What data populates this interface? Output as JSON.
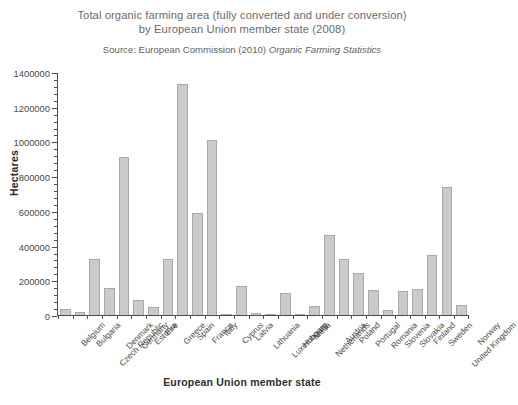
{
  "chart_data": {
    "type": "bar",
    "title": "Total organic farming area (fully converted and under conversion) by European Union member state (2008)",
    "title_line1": "Total organic farming area (fully converted and under conversion)",
    "title_line2": "by European Union member state (2008)",
    "source_prefix": "Source: European Commission (2010) ",
    "source_italic": "Organic Farming Statistics",
    "xlabel": "European Union member state",
    "ylabel": "Hectares",
    "ylim": [
      0,
      1400000
    ],
    "ytick_step": 200000,
    "yticks": [
      0,
      200000,
      400000,
      600000,
      800000,
      1000000,
      1200000,
      1400000
    ],
    "ytick_labels": [
      "0",
      "200000",
      "400000",
      "600000",
      "800000",
      "1000000",
      "1200000",
      "1400000"
    ],
    "minor_ticks_per_major": 4,
    "grid": false,
    "legend": false,
    "bar_color": "#cbcbcb",
    "bar_edge_color": "#a9a9a9",
    "categories": [
      "Belgium",
      "Bulgaria",
      "Czech Republic",
      "Denmark",
      "Germany",
      "Estonia",
      "Eire",
      "Greece",
      "Spain",
      "France",
      "Italy",
      "Cyprus",
      "Latvia",
      "Lithuania",
      "Luxembourg",
      "Hungary",
      "Malta",
      "Netherlands",
      "Austria",
      "Poland",
      "Portugal",
      "Romania",
      "Slovenia",
      "Slovakia",
      "Finland",
      "Sweden",
      "United Kingdom",
      "Norway"
    ],
    "values": [
      35000,
      15000,
      325000,
      155000,
      910000,
      87000,
      45000,
      325000,
      1330000,
      585000,
      1010000,
      7000,
      165000,
      12000,
      4000,
      125000,
      1000,
      50000,
      460000,
      320000,
      240000,
      145000,
      30000,
      140000,
      150000,
      345000,
      740000,
      55000
    ]
  }
}
